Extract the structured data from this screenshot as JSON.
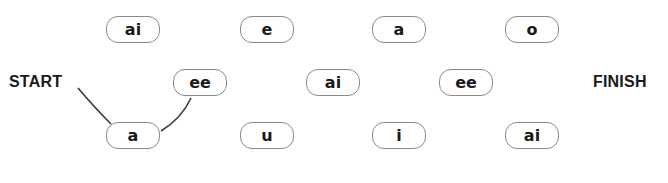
{
  "start_label": "START",
  "finish_label": "FINISH",
  "rows": {
    "top": [
      {
        "text": "ai"
      },
      {
        "text": "e"
      },
      {
        "text": "a"
      },
      {
        "text": "o"
      }
    ],
    "middle": [
      {
        "text": "ee"
      },
      {
        "text": "ai"
      },
      {
        "text": "ee"
      }
    ],
    "bottom": [
      {
        "text": "a"
      },
      {
        "text": "u"
      },
      {
        "text": "i"
      },
      {
        "text": "ai"
      }
    ]
  },
  "drawn_path": [
    "START",
    "a (bottom-1)",
    "ee (middle-1)"
  ],
  "colors": {
    "line": "#3a3a3a",
    "border": "#8a8a8a",
    "text": "#1a1a1a"
  }
}
